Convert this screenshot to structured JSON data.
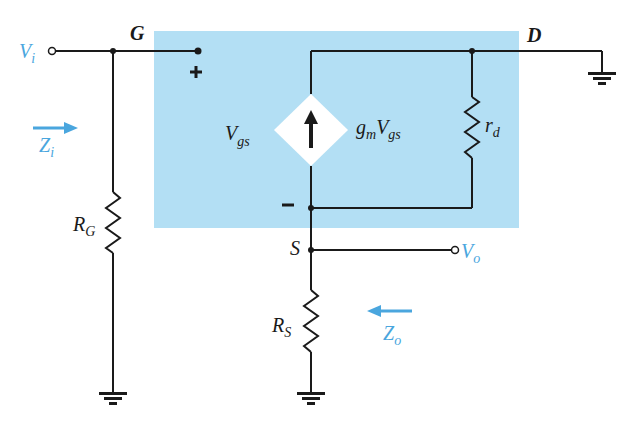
{
  "diagram": {
    "colors": {
      "background": "#ffffff",
      "model_box": "#b3dff4",
      "wire": "#1a1a1a",
      "accent": "#4aa6de"
    },
    "nodes": {
      "gate": "G",
      "drain": "D",
      "source": "S"
    },
    "terminals": {
      "input_main": "V",
      "input_sub": "i",
      "output_main": "V",
      "output_sub": "o"
    },
    "impedances": {
      "input_main": "Z",
      "input_sub": "i",
      "output_main": "Z",
      "output_sub": "o"
    },
    "components": {
      "rg_main": "R",
      "rg_sub": "G",
      "rs_main": "R",
      "rs_sub": "S",
      "rd_main": "r",
      "rd_sub": "d",
      "vgs_main": "V",
      "vgs_sub": "gs",
      "source_gm": "g",
      "source_gm_sub": "m",
      "source_v": "V",
      "source_v_sub": "gs"
    },
    "polarity": {
      "plus": "+",
      "minus": "−"
    }
  }
}
